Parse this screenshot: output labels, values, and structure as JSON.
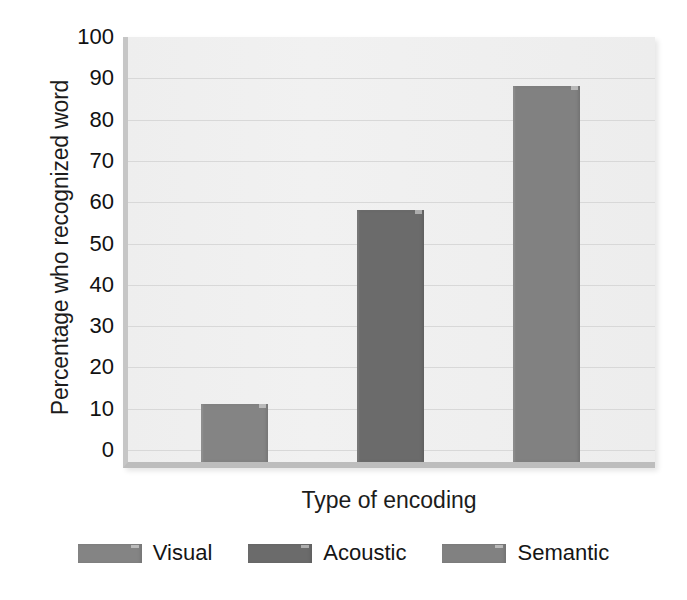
{
  "chart_data": {
    "type": "bar",
    "title": "",
    "categories": [
      "Visual",
      "Acoustic",
      "Semantic"
    ],
    "values": [
      14,
      61,
      91
    ],
    "series": [
      {
        "name": "Percentage who recognized word",
        "values": [
          14,
          61,
          91
        ]
      }
    ],
    "xlabel": "Type of encoding",
    "ylabel": "Percentage who recognized word",
    "ylim": [
      0,
      100
    ],
    "yticks": [
      0,
      10,
      20,
      30,
      40,
      50,
      60,
      70,
      80,
      90,
      100
    ],
    "ytick_labels": [
      "0",
      "10",
      "20",
      "30",
      "40",
      "50",
      "60",
      "70",
      "80",
      "90",
      "100"
    ],
    "xticks": [],
    "xtick_labels": [],
    "grid": true,
    "legend_position": "bottom",
    "bar_colors": [
      "#848484",
      "#6b6b6b",
      "#818181"
    ],
    "plot_background": "#f0f0f0",
    "gridline_color": "#d8d8d8"
  },
  "axes": {
    "y_title": "Percentage who recognized word",
    "x_title": "Type of encoding"
  },
  "legend": {
    "items": [
      {
        "label": "Visual",
        "color": "#848484"
      },
      {
        "label": "Acoustic",
        "color": "#6b6b6b"
      },
      {
        "label": "Semantic",
        "color": "#818181"
      }
    ]
  }
}
